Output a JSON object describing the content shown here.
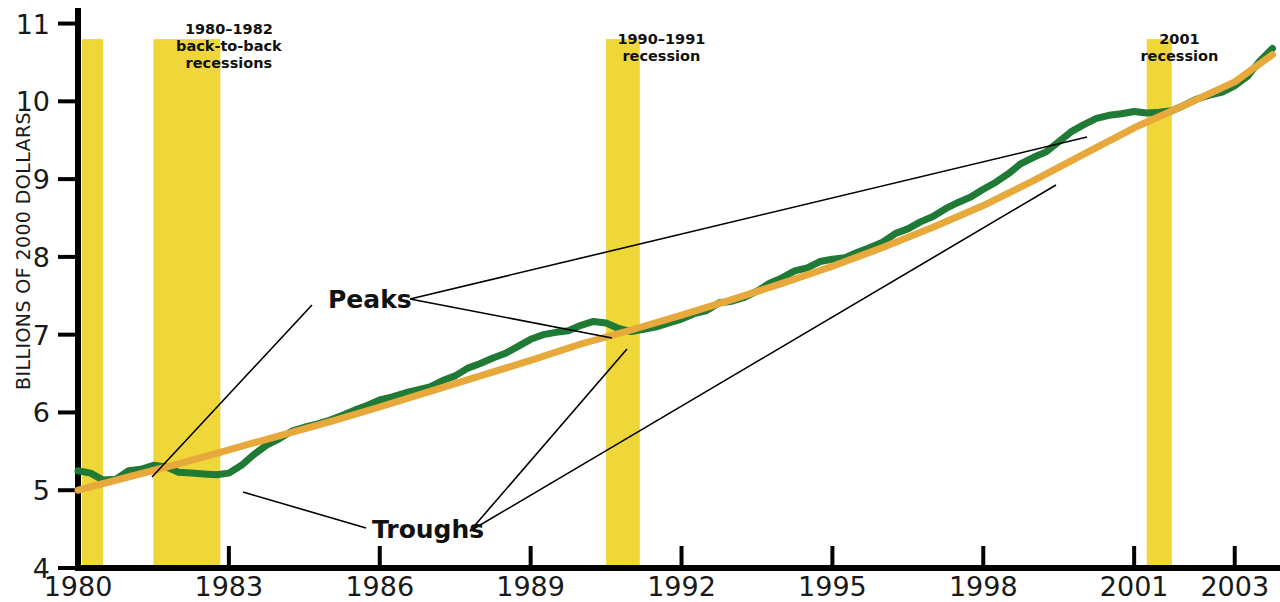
{
  "figure": {
    "background_color": "#ffffff",
    "axis_color": "#000000"
  },
  "chart_data": {
    "type": "line",
    "title": "",
    "subtitle": "",
    "xlabel": "",
    "ylabel": "BILLIONS OF 2000 DOLLARS",
    "xlim": [
      1980,
      2003.9
    ],
    "ylim": [
      4,
      11.2
    ],
    "grid": false,
    "legend": "none",
    "x_ticks": [
      1980,
      1983,
      1986,
      1989,
      1992,
      1995,
      1998,
      2001,
      2003
    ],
    "x_tick_labels": [
      "1980",
      "1983",
      "1986",
      "1989",
      "1992",
      "1995",
      "1998",
      "2001",
      "2003"
    ],
    "y_ticks": [
      4,
      5,
      6,
      7,
      8,
      9,
      10,
      11
    ],
    "y_tick_labels": [
      "4",
      "5",
      "6",
      "7",
      "8",
      "9",
      "10",
      "11"
    ],
    "series": [
      {
        "name": "Actual real GDP",
        "color": "#1f7a36",
        "line_width": 7,
        "x": [
          1980.0,
          1980.25,
          1980.5,
          1980.75,
          1981.0,
          1981.25,
          1981.5,
          1981.75,
          1982.0,
          1982.25,
          1982.5,
          1982.75,
          1983.0,
          1983.25,
          1983.5,
          1983.75,
          1984.0,
          1984.25,
          1984.5,
          1984.75,
          1985.0,
          1985.25,
          1985.5,
          1985.75,
          1986.0,
          1986.25,
          1986.5,
          1986.75,
          1987.0,
          1987.25,
          1987.5,
          1987.75,
          1988.0,
          1988.25,
          1988.5,
          1988.75,
          1989.0,
          1989.25,
          1989.5,
          1989.75,
          1990.0,
          1990.25,
          1990.5,
          1990.75,
          1991.0,
          1991.25,
          1991.5,
          1991.75,
          1992.0,
          1992.25,
          1992.5,
          1992.75,
          1993.0,
          1993.25,
          1993.5,
          1993.75,
          1994.0,
          1994.25,
          1994.5,
          1994.75,
          1995.0,
          1995.25,
          1995.5,
          1995.75,
          1996.0,
          1996.25,
          1996.5,
          1996.75,
          1997.0,
          1997.25,
          1997.5,
          1997.75,
          1998.0,
          1998.25,
          1998.5,
          1998.75,
          1999.0,
          1999.25,
          1999.5,
          1999.75,
          2000.0,
          2000.25,
          2000.5,
          2000.75,
          2001.0,
          2001.25,
          2001.5,
          2001.75,
          2002.0,
          2002.25,
          2002.5,
          2002.75,
          2003.0,
          2003.25,
          2003.5,
          2003.75
        ],
        "y": [
          5.25,
          5.22,
          5.13,
          5.14,
          5.25,
          5.27,
          5.32,
          5.3,
          5.23,
          5.22,
          5.21,
          5.2,
          5.22,
          5.32,
          5.46,
          5.58,
          5.66,
          5.76,
          5.81,
          5.85,
          5.9,
          5.96,
          6.03,
          6.09,
          6.16,
          6.2,
          6.25,
          6.29,
          6.33,
          6.41,
          6.47,
          6.57,
          6.63,
          6.7,
          6.76,
          6.85,
          6.94,
          7.0,
          7.03,
          7.05,
          7.12,
          7.17,
          7.15,
          7.08,
          7.04,
          7.07,
          7.1,
          7.15,
          7.2,
          7.27,
          7.31,
          7.41,
          7.43,
          7.48,
          7.56,
          7.66,
          7.73,
          7.82,
          7.86,
          7.94,
          7.97,
          7.99,
          8.06,
          8.12,
          8.19,
          8.3,
          8.36,
          8.45,
          8.52,
          8.62,
          8.7,
          8.77,
          8.87,
          8.96,
          9.07,
          9.2,
          9.28,
          9.35,
          9.48,
          9.61,
          9.7,
          9.78,
          9.82,
          9.84,
          9.87,
          9.85,
          9.86,
          9.88,
          9.95,
          10.03,
          10.08,
          10.12,
          10.2,
          10.32,
          10.52,
          10.68
        ]
      },
      {
        "name": "Potential real GDP",
        "color": "#e8a93c",
        "line_width": 7,
        "x": [
          1980.0,
          1981.0,
          1982.0,
          1983.0,
          1984.0,
          1985.0,
          1986.0,
          1987.0,
          1988.0,
          1989.0,
          1990.0,
          1991.0,
          1992.0,
          1993.0,
          1994.0,
          1995.0,
          1996.0,
          1997.0,
          1998.0,
          1999.0,
          2000.0,
          2001.0,
          2002.0,
          2003.0,
          2003.75
        ],
        "y": [
          5.0,
          5.17,
          5.34,
          5.52,
          5.7,
          5.88,
          6.07,
          6.27,
          6.47,
          6.67,
          6.88,
          7.06,
          7.25,
          7.45,
          7.66,
          7.88,
          8.12,
          8.38,
          8.66,
          8.98,
          9.32,
          9.66,
          9.95,
          10.25,
          10.6
        ]
      }
    ],
    "recession_bands": [
      {
        "id": "recession-1980",
        "start": 1980.08,
        "end": 1980.5,
        "color": "#efd639",
        "top_value": 10.8
      },
      {
        "id": "recession-1981-1982",
        "start": 1981.5,
        "end": 1982.83,
        "color": "#efd639",
        "top_value": 10.8
      },
      {
        "id": "recession-1990-1991",
        "start": 1990.5,
        "end": 1991.17,
        "color": "#efd639",
        "top_value": 10.8
      },
      {
        "id": "recession-2001",
        "start": 2001.25,
        "end": 2001.75,
        "color": "#efd639",
        "top_value": 10.8
      }
    ],
    "band_annotations": [
      {
        "id": "label-1980-1982",
        "lines": [
          "1980–1982",
          "back-to-back",
          "recessions"
        ],
        "x": 1983.0,
        "y_px": 34
      },
      {
        "id": "label-1990-1991",
        "lines": [
          "1990–1991",
          "recession"
        ],
        "x": 1991.6,
        "y_px": 44
      },
      {
        "id": "label-2001",
        "lines": [
          "2001",
          "recession"
        ],
        "x": 2001.9,
        "y_px": 44
      }
    ],
    "callouts": [
      {
        "id": "peaks",
        "label": "Peaks",
        "label_x_px": 328,
        "label_y_px": 308,
        "anchor_x_px": 410,
        "anchor_y_px": 299,
        "targets": [
          {
            "name": "peak-1990",
            "x_px": 612,
            "y_px": 338
          },
          {
            "name": "peak-2000",
            "x_px": 1087,
            "y_px": 137
          }
        ]
      },
      {
        "id": "troughs",
        "label": "Troughs",
        "label_x_px": 372,
        "label_y_px": 538,
        "anchor_x_px": 470,
        "anchor_y_px": 531,
        "targets": [
          {
            "name": "trough-1991",
            "x_px": 627,
            "y_px": 349
          },
          {
            "name": "trough-2001",
            "x_px": 1056,
            "y_px": 185
          }
        ]
      }
    ],
    "extra_leaders": [
      {
        "name": "leader-1982-trough",
        "from_x_px": 312,
        "from_y_px": 305,
        "to_x_px": 152,
        "to_y_px": 477
      },
      {
        "name": "leader-1983-trough",
        "from_x_px": 366,
        "from_y_px": 528,
        "to_x_px": 243,
        "to_y_px": 492
      }
    ]
  }
}
